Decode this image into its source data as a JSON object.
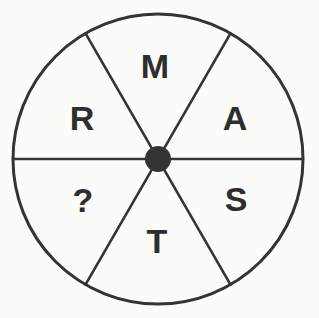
{
  "figure": {
    "name": "spoked-wheel-letter-puzzle",
    "background_color": "#fbfbf9",
    "stroke_color": "#343434",
    "hub_color": "#333333",
    "text_color": "#2e2e2e",
    "circle": {
      "center_x": 158,
      "center_y": 159,
      "radius": 145,
      "stroke_width": 3
    },
    "hub": {
      "center_x": 158,
      "center_y": 159,
      "radius": 13
    },
    "spokes": {
      "count": 6,
      "angles_deg": [
        0,
        60,
        120,
        180,
        240,
        300
      ],
      "stroke_width": 2.6
    }
  },
  "sectors": [
    {
      "id": "sector-top",
      "label": "M",
      "position_deg": 90,
      "label_x": 155,
      "label_y": 69,
      "font_size": 34
    },
    {
      "id": "sector-upper-right",
      "label": "A",
      "position_deg": 30,
      "label_x": 235,
      "label_y": 121,
      "font_size": 34
    },
    {
      "id": "sector-lower-right",
      "label": "S",
      "position_deg": -30,
      "label_x": 236,
      "label_y": 202,
      "font_size": 34
    },
    {
      "id": "sector-bottom",
      "label": "T",
      "position_deg": -90,
      "label_x": 157,
      "label_y": 244,
      "font_size": 34
    },
    {
      "id": "sector-lower-left",
      "label": "?",
      "position_deg": -150,
      "label_x": 83,
      "label_y": 203,
      "font_size": 34
    },
    {
      "id": "sector-upper-left",
      "label": "R",
      "position_deg": 150,
      "label_x": 82,
      "label_y": 121,
      "font_size": 34
    }
  ]
}
